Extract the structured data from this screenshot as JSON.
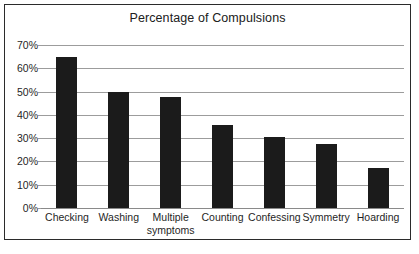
{
  "chart_data": {
    "type": "bar",
    "title": "Percentage of Compulsions",
    "xlabel": "",
    "ylabel": "",
    "categories": [
      "Checking",
      "Washing",
      "Multiple symptoms",
      "Counting",
      "Confessing",
      "Symmetry",
      "Hoarding"
    ],
    "category_lines": [
      [
        "Checking"
      ],
      [
        "Washing"
      ],
      [
        "Multiple",
        "symptoms"
      ],
      [
        "Counting"
      ],
      [
        "Confessing"
      ],
      [
        "Symmetry"
      ],
      [
        "Hoarding"
      ]
    ],
    "values": [
      65,
      50,
      47.5,
      35.5,
      30.5,
      27.5,
      17
    ],
    "ylim": [
      0,
      70
    ],
    "ytick_values": [
      70,
      60,
      50,
      40,
      30,
      20,
      10,
      0
    ],
    "ytick_labels": [
      "70%",
      "60%",
      "50%",
      "40%",
      "30%",
      "20%",
      "10%",
      "0%"
    ],
    "grid": true,
    "legend": false,
    "bar_color": "#1b1b1b",
    "grid_color": "#9c9c9c",
    "frame_color": "#2b2b2b"
  }
}
